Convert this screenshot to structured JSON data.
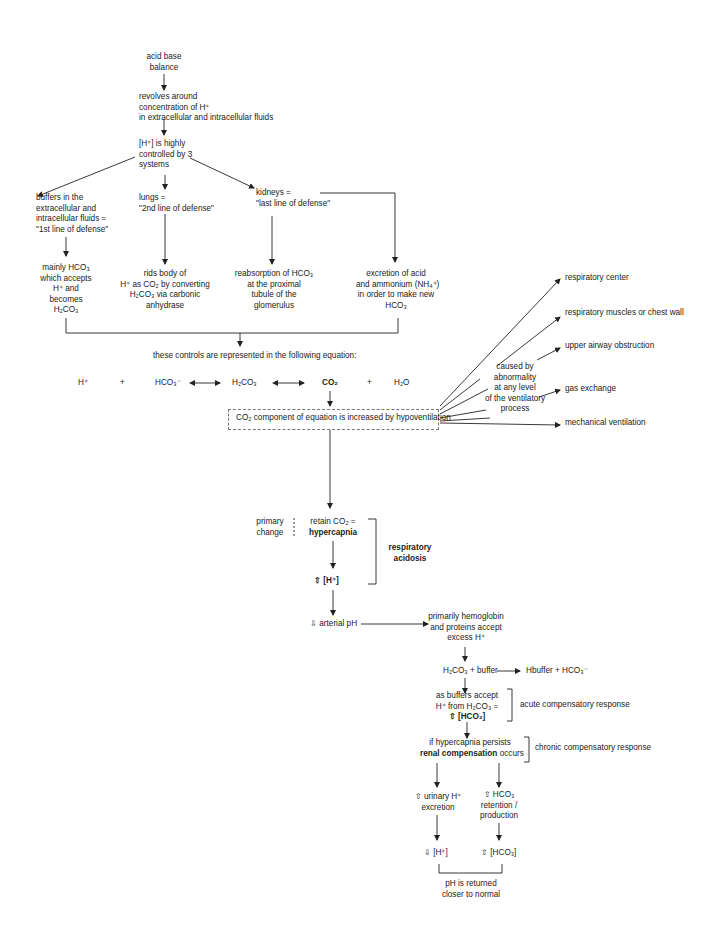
{
  "title_node": {
    "lines": [
      "acid base",
      "balance"
    ]
  },
  "revolves": {
    "lines": [
      "revolves around",
      "concentration of H⁺",
      "in extracellular and intracellular fluids"
    ]
  },
  "controlled": {
    "lines": [
      "[H⁺] is highly",
      "controlled by 3",
      "systems"
    ]
  },
  "systems": {
    "buffers": {
      "lines": [
        "buffers in the",
        "extracellular and",
        "intracellular fluids =",
        "\"1st line of defense\""
      ]
    },
    "lungs": {
      "lines": [
        "lungs =",
        "\"2nd line of defense\""
      ]
    },
    "kidneys": {
      "lines": [
        "kidneys =",
        "\"last line of defense\""
      ]
    }
  },
  "outcomes": {
    "buffers": {
      "lines": [
        "mainly HCO₃",
        "which accepts",
        "H⁺ and",
        "becomes",
        "H₂CO₃"
      ]
    },
    "lungs": {
      "lines": [
        "rids body of",
        "H⁺ as CO₂ by converting",
        "H₂CO₃ via carbonic",
        "anhydrase"
      ]
    },
    "kidneys_reabsorb": {
      "lines": [
        "reabsorption of HCO₃",
        "at the proximal",
        "tubule of the",
        "glomerulus"
      ]
    },
    "kidneys_excrete": {
      "lines": [
        "excretion of acid",
        "and ammonium (NH₄⁺)",
        "in order to make new",
        "HCO₃"
      ]
    }
  },
  "equation": {
    "intro": "these controls are represented in the following equation:",
    "terms": [
      "H⁺",
      "+",
      "HCO₃⁻",
      "H₂CO₃",
      "CO₂",
      "+",
      "H₂O"
    ]
  },
  "hypoventilation_box": "CO₂ component of equation is increased by hypoventilation",
  "causes": {
    "label": {
      "lines": [
        "caused by",
        "abnormality",
        "at any level",
        "of the ventilatory",
        "process"
      ]
    },
    "items": [
      "respiratory center",
      "respiratory muscles or chest wall",
      "upper airway obstruction",
      "gas exchange",
      "mechanical ventilation"
    ]
  },
  "primary_change": {
    "lines": [
      "primary",
      "change"
    ]
  },
  "retain": {
    "line1": "retain CO₂ =",
    "line2": "hypercapnia"
  },
  "increased_h": "⇧ [H⁺]",
  "condition": {
    "lines": [
      "respiratory",
      "acidosis"
    ]
  },
  "arterial_ph": "⇩ arterial pH",
  "hemoglobin": {
    "lines": [
      "primarily hemoglobin",
      "and proteins accept",
      "excess H⁺"
    ]
  },
  "buffer_reaction": {
    "left": "H₂CO₃ + buffer",
    "right": "Hbuffer + HCO₃⁻"
  },
  "acute": {
    "lines": [
      "as buffers accept",
      "H⁺ from H₂CO₃ =",
      "⇧ [HCO₃]"
    ],
    "label": "acute compensatory response"
  },
  "chronic": {
    "line1": "if hypercapnia persists",
    "line2_bold": "renal compensation",
    "line2_rest": " occurs",
    "label": "chronic compensatory response"
  },
  "renal": {
    "urinary": {
      "lines": [
        "⇧ urinary H⁺",
        "excretion"
      ]
    },
    "hco3": {
      "lines": [
        "⇧ HCO₃",
        "retention /",
        "production"
      ]
    },
    "h_down": "⇩ [H⁺]",
    "hco3_up": "⇧ [HCO₃]"
  },
  "result": {
    "lines": [
      "pH is returned",
      "closer to normal"
    ]
  }
}
